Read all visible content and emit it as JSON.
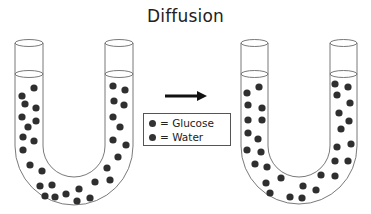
{
  "title": "Diffusion",
  "colors": {
    "dot": "#2f2f2f",
    "tube_stroke": "#6a6a6a",
    "arrow": "#111111"
  },
  "legend": {
    "items": [
      {
        "label": "= Glucose",
        "color": "#333333"
      },
      {
        "label": "= Water",
        "color": "#333333"
      }
    ]
  },
  "arrow": {
    "direction": "right"
  },
  "tubes": [
    {
      "name": "before",
      "center_x": 74,
      "dots": [
        [
          22,
          96
        ],
        [
          34,
          88
        ],
        [
          25,
          104
        ],
        [
          36,
          108
        ],
        [
          22,
          117
        ],
        [
          28,
          127
        ],
        [
          36,
          121
        ],
        [
          23,
          137
        ],
        [
          34,
          141
        ],
        [
          23,
          150
        ],
        [
          113,
          86
        ],
        [
          125,
          90
        ],
        [
          114,
          101
        ],
        [
          124,
          105
        ],
        [
          113,
          117
        ],
        [
          120,
          127
        ],
        [
          113,
          140
        ],
        [
          126,
          145
        ],
        [
          118,
          157
        ],
        [
          107,
          168
        ],
        [
          30,
          165
        ],
        [
          42,
          171
        ],
        [
          40,
          186
        ],
        [
          52,
          185
        ],
        [
          45,
          196
        ],
        [
          55,
          197
        ],
        [
          66,
          194
        ],
        [
          79,
          189
        ],
        [
          77,
          201
        ],
        [
          90,
          198
        ],
        [
          95,
          182
        ],
        [
          110,
          180
        ]
      ]
    },
    {
      "name": "after",
      "center_x": 299,
      "dots": [
        [
          247,
          93
        ],
        [
          259,
          87
        ],
        [
          248,
          105
        ],
        [
          262,
          108
        ],
        [
          248,
          120
        ],
        [
          262,
          120
        ],
        [
          248,
          133
        ],
        [
          258,
          139
        ],
        [
          247,
          150
        ],
        [
          261,
          152
        ],
        [
          335,
          84
        ],
        [
          348,
          87
        ],
        [
          337,
          95
        ],
        [
          350,
          103
        ],
        [
          339,
          113
        ],
        [
          349,
          121
        ],
        [
          341,
          129
        ],
        [
          337,
          147
        ],
        [
          351,
          144
        ],
        [
          335,
          161
        ],
        [
          348,
          161
        ],
        [
          255,
          164
        ],
        [
          267,
          167
        ],
        [
          266,
          183
        ],
        [
          281,
          178
        ],
        [
          270,
          193
        ],
        [
          290,
          197
        ],
        [
          302,
          198
        ],
        [
          303,
          186
        ],
        [
          316,
          190
        ],
        [
          321,
          175
        ],
        [
          335,
          176
        ]
      ]
    }
  ]
}
